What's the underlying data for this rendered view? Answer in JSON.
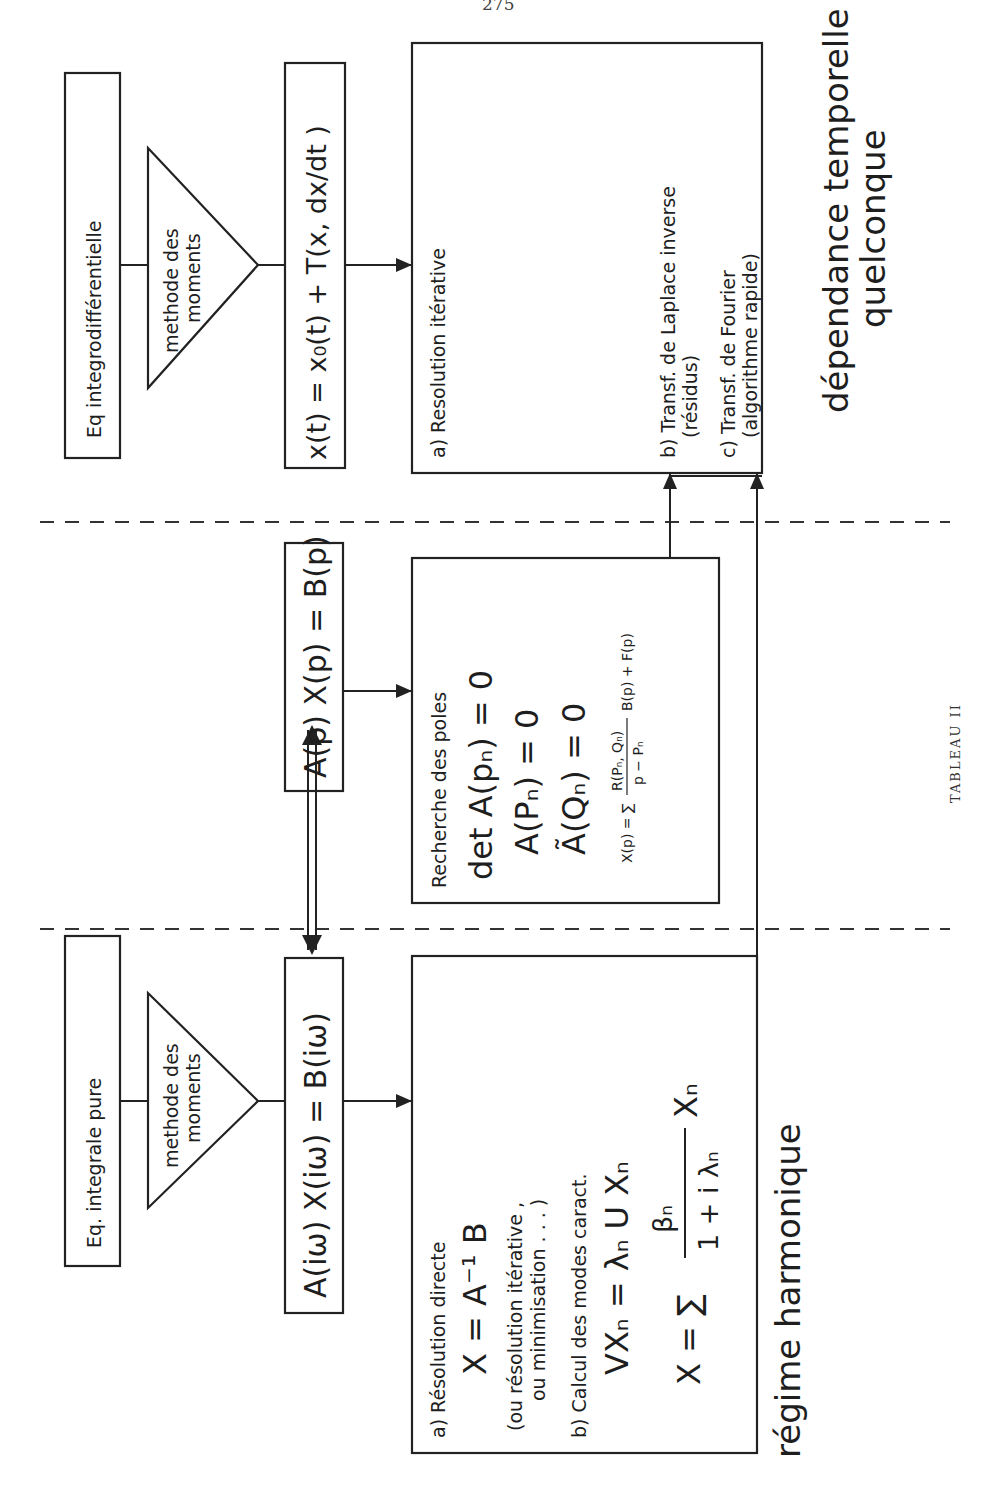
{
  "page": {
    "page_number": "275",
    "caption": "TABLEAU II",
    "orientation": "rotated 90° counter-clockwise"
  },
  "regions": {
    "harmonic": "régime harmonique",
    "temporal_line1": "dépendance temporelle",
    "temporal_line2": "quelconque"
  },
  "harmonic_column": {
    "source_box": "Eq. integrale pure",
    "method_triangle_line1": "methode des",
    "method_triangle_line2": "moments",
    "equation_box": "A(iω) X(iω) = B(iω)",
    "solution_box": {
      "a_label": "a) Résolution directe",
      "a_formula": "X = A⁻¹ B",
      "a_note_line1": "(ou résolution itérative ,",
      "a_note_line2": "ou minimisation . . . )",
      "b_label": "b) Calcul des modes caract.",
      "b_formula1": "VXₙ = λₙ U Xₙ",
      "b_formula2_lhs": "X = ∑",
      "b_formula2_num": "βₙ",
      "b_formula2_den": "1 + i λₙ",
      "b_formula2_rhs": "Xₙ"
    }
  },
  "laplace_column": {
    "equation_box": "A(p) X(p) = B(p)",
    "poles_box": {
      "title": "Recherche des poles",
      "eq1": "det A(pₙ) = 0",
      "eq2": "A(Pₙ) = 0",
      "eq3": "Ã(Qₙ) = 0",
      "eq4_lhs": "X(p) = ∑",
      "eq4_num": "R(Pₙ, Qₙ)",
      "eq4_den": "p − Pₙ",
      "eq4_rhs": "B(p) + F(p)"
    }
  },
  "temporal_column": {
    "source_box": "Eq integrodifférentielle",
    "method_triangle_line1": "methode des",
    "method_triangle_line2": "moments",
    "equation_box": "x(t) = x₀(t) + T(x, dx/dt )",
    "solution_box": {
      "a_label": "a) Resolution  itérative",
      "b_label": "b) Transf. de Laplace inverse",
      "b_note": "(résidus)",
      "c_label": "c) Transf. de Fourier",
      "c_note": "(algorithme  rapide)"
    }
  },
  "connectors": {
    "double_arrow": "equivalence between harmonic and Laplace equations",
    "arrow_b": "poles box → Laplace inverse transform",
    "arrow_c": "harmonic solution → Fourier transform"
  },
  "colors": {
    "ink": "#222222",
    "paper": "#ffffff"
  }
}
